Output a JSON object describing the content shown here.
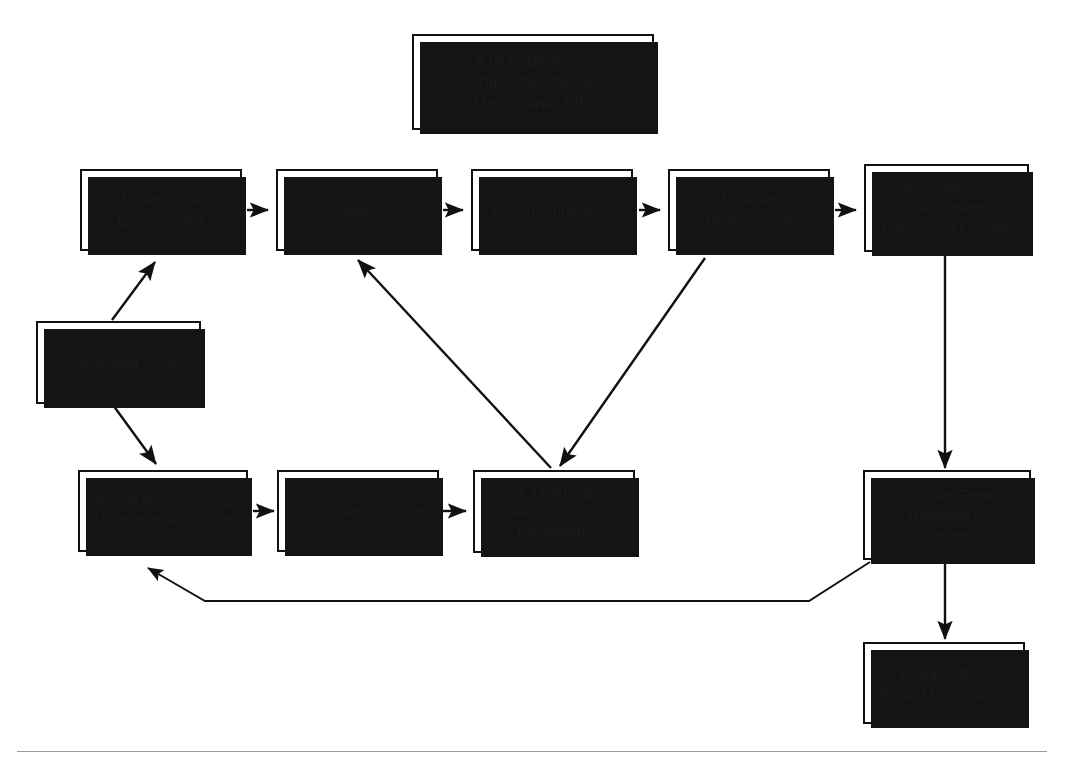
{
  "diagram": {
    "kind": "systems-influence-diagram",
    "title_box": {
      "id": "title",
      "label": "IQA Experience\nComposite Interview\nUncluttered SID"
    },
    "nodes": [
      {
        "id": "n11",
        "number": "11",
        "label": "11. Physical\nEnvironment"
      },
      {
        "id": "n3",
        "number": "3",
        "label": "3. Collaboration"
      },
      {
        "id": "n4",
        "number": "4",
        "label": "4. Communication"
      },
      {
        "id": "n10",
        "number": "10",
        "label": "10. Peer\nRelationship"
      },
      {
        "id": "n6",
        "number": "6",
        "label": "6. Emotional\nEnvironment /\nClassroom Climate"
      },
      {
        "id": "n7",
        "number": "7",
        "label": "7. Instructor Style"
      },
      {
        "id": "n8",
        "number": "8",
        "label": "8. IQA Process as a\nMethod of Research"
      },
      {
        "id": "n5",
        "number": "5",
        "label": "5. Course Structure"
      },
      {
        "id": "n9",
        "number": "9",
        "label": "9. Learning\nResources /\nTechnology"
      },
      {
        "id": "n2",
        "number": "2",
        "label": "2. Cognitive Reaction\n(Dialectic) /\nComprehension"
      },
      {
        "id": "n1",
        "number": "1",
        "label": "1. Application\nToward Dissertation"
      }
    ],
    "edges": [
      {
        "id": "e-11-3",
        "from": "n11",
        "to": "n3",
        "style": "straight-horizontal"
      },
      {
        "id": "e-3-4",
        "from": "n3",
        "to": "n4",
        "style": "straight-horizontal"
      },
      {
        "id": "e-4-10",
        "from": "n4",
        "to": "n10",
        "style": "straight-horizontal"
      },
      {
        "id": "e-10-6",
        "from": "n10",
        "to": "n6",
        "style": "straight-horizontal"
      },
      {
        "id": "e-7-11",
        "from": "n7",
        "to": "n11",
        "style": "diagonal-up-right"
      },
      {
        "id": "e-7-8",
        "from": "n7",
        "to": "n8",
        "style": "diagonal-down-right"
      },
      {
        "id": "e-8-5",
        "from": "n8",
        "to": "n5",
        "style": "straight-horizontal"
      },
      {
        "id": "e-5-9",
        "from": "n5",
        "to": "n9",
        "style": "straight-horizontal"
      },
      {
        "id": "e-9-3",
        "from": "n9",
        "to": "n3",
        "style": "diagonal-up-left"
      },
      {
        "id": "e-10-9",
        "from": "n10",
        "to": "n9",
        "style": "diagonal-down-left"
      },
      {
        "id": "e-6-2",
        "from": "n6",
        "to": "n2",
        "style": "straight-vertical"
      },
      {
        "id": "e-2-1",
        "from": "n2",
        "to": "n1",
        "style": "straight-vertical"
      },
      {
        "id": "e-2-8",
        "from": "n2",
        "to": "n8",
        "style": "feedback-loop-bottom"
      }
    ],
    "colors": {
      "box_fill": "#ffffff",
      "box_stroke": "#111111",
      "box_shadow": "#141414",
      "edge_stroke": "#111111",
      "text": "#1a1a1a",
      "footer_rule": "#9a9a9a"
    }
  }
}
